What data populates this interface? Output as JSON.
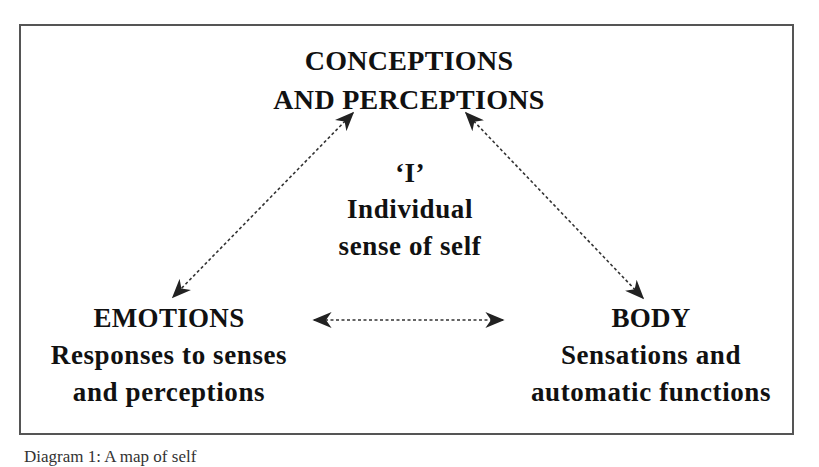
{
  "diagram": {
    "nodes": {
      "top": {
        "title_line1": "CONCEPTIONS",
        "title_line2": "AND PERCEPTIONS"
      },
      "center": {
        "title": "‘I’",
        "sub_line1": "Individual",
        "sub_line2": "sense of self"
      },
      "left": {
        "title": "EMOTIONS",
        "sub_line1": "Responses to senses",
        "sub_line2": "and perceptions"
      },
      "right": {
        "title": "BODY",
        "sub_line1": "Sensations and",
        "sub_line2": "automatic functions"
      }
    },
    "connections": [
      {
        "from": "top",
        "to": "left",
        "style": "dotted",
        "direction": "bidirectional"
      },
      {
        "from": "top",
        "to": "right",
        "style": "dotted",
        "direction": "bidirectional"
      },
      {
        "from": "left",
        "to": "right",
        "style": "dotted",
        "direction": "bidirectional"
      }
    ],
    "colors": {
      "text": "#111111",
      "border": "#555555",
      "arrow": "#222222"
    }
  },
  "caption": "Diagram 1: A map of self"
}
